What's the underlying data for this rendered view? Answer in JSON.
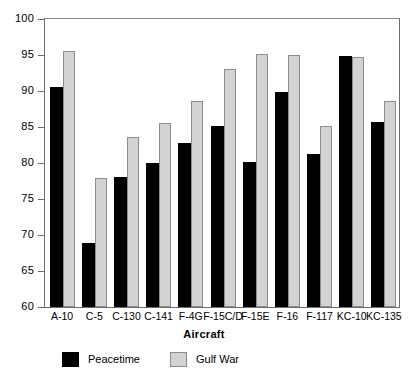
{
  "chart_data": {
    "type": "bar",
    "title": "",
    "subtitle": "",
    "xlabel": "Aircraft",
    "ylabel": "",
    "ylim": [
      60,
      100
    ],
    "ytick_step": 5,
    "yticks": [
      100,
      95,
      90,
      85,
      80,
      75,
      70,
      65,
      60
    ],
    "grid": false,
    "legend_position": "bottom-left",
    "categories": [
      "A-10",
      "C-5",
      "C-130",
      "C-141",
      "F-4G",
      "F-15C/D",
      "F-15E",
      "F-16",
      "F-117",
      "KC-10",
      "KC-135"
    ],
    "series": [
      {
        "name": "Peacetime",
        "color": "#000000",
        "values": [
          90.5,
          68.9,
          78.0,
          80.0,
          82.8,
          85.1,
          80.1,
          89.9,
          81.3,
          94.8,
          85.7
        ]
      },
      {
        "name": "Gulf War",
        "color": "#d3d3d3",
        "values": [
          95.5,
          77.9,
          83.6,
          85.5,
          88.6,
          93.0,
          95.1,
          95.0,
          85.1,
          94.7,
          88.6
        ]
      }
    ]
  },
  "legend": {
    "entries": [
      {
        "label": "Peacetime",
        "swatch": "black-square-swatch"
      },
      {
        "label": "Gulf War",
        "swatch": "gray-square-swatch"
      }
    ]
  },
  "axis": {
    "x_title": "Aircraft",
    "y_tick_labels": [
      "100",
      "95",
      "90",
      "85",
      "80",
      "75",
      "70",
      "65",
      "60"
    ],
    "x_tick_labels": [
      "A-10",
      "C-5",
      "C-130",
      "C-141",
      "F-4G",
      "F-15C/D",
      "F-15E",
      "F-16",
      "F-117",
      "KC-10",
      "KC-135"
    ]
  },
  "colors": {
    "peacetime": "#000000",
    "gulf_war": "#d3d3d3",
    "frame": "#6e6e6e",
    "background": "#ffffff"
  }
}
